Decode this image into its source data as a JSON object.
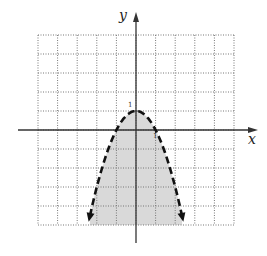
{
  "chart_data": {
    "type": "line",
    "title": "",
    "xlabel": "x",
    "ylabel": "y",
    "xlim": [
      -5,
      5
    ],
    "ylim": [
      -5,
      5
    ],
    "grid": true,
    "grid_style": "dotted",
    "tick_labels": {
      "x": [
        "1"
      ],
      "y": [
        "1"
      ]
    },
    "series": [
      {
        "name": "boundary",
        "equation": "y = 1 - x^2",
        "line_style": "dashed",
        "x": [
          -2.35,
          -2,
          -1.5,
          -1,
          -0.5,
          0,
          0.5,
          1,
          1.5,
          2,
          2.35
        ],
        "y": [
          -4.52,
          -3,
          -1.25,
          0,
          0.75,
          1,
          0.75,
          0,
          -1.25,
          -3,
          -4.52
        ]
      }
    ],
    "shaded_region": "y < 1 - x^2",
    "vertex": [
      0,
      1
    ],
    "x_intercepts": [
      -1,
      1
    ],
    "colors": {
      "shade": "#d9d9d9",
      "curve": "#111111",
      "grid": "#777777",
      "axes": "#333333"
    }
  },
  "labels": {
    "x_axis": "x",
    "y_axis": "y",
    "x_tick": "1",
    "y_tick": "1"
  }
}
